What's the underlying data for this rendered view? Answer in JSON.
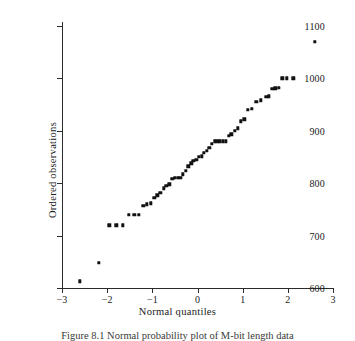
{
  "figure": {
    "caption": "Figure 8.1   Normal probability plot of M-bit length data",
    "caption_number": "Figure 8.1",
    "caption_text": "Normal probability plot of M-bit length data"
  },
  "chart_data": {
    "type": "scatter",
    "title": "",
    "xlabel": "Normal quantiles",
    "ylabel": "Ordered observations",
    "xlim": [
      -3,
      3
    ],
    "ylim": [
      600,
      1100
    ],
    "xticks": [
      -3,
      -2,
      -1,
      0,
      1,
      2,
      3
    ],
    "xticklabels": [
      "−3",
      "−2",
      "−1",
      "0",
      "1",
      "2",
      "3"
    ],
    "yticks": [
      600,
      700,
      800,
      900,
      1000,
      1100
    ],
    "yticklabels": [
      "600",
      "700",
      "800",
      "900",
      "1000",
      "1100"
    ],
    "grid": false,
    "legend": null,
    "marker": "square",
    "marker_color": "#111111",
    "axis_color": "#2b2b2b",
    "series": [
      {
        "name": "Ordered observations vs normal quantiles",
        "points": [
          [
            -2.6,
            613
          ],
          [
            -2.18,
            648
          ],
          [
            -1.95,
            720
          ],
          [
            -1.8,
            720
          ],
          [
            -1.66,
            720
          ],
          [
            -1.52,
            740
          ],
          [
            -1.4,
            740
          ],
          [
            -1.3,
            740
          ],
          [
            -1.2,
            757
          ],
          [
            -1.12,
            760
          ],
          [
            -1.04,
            762
          ],
          [
            -0.96,
            772
          ],
          [
            -0.89,
            777
          ],
          [
            -0.82,
            782
          ],
          [
            -0.75,
            790
          ],
          [
            -0.69,
            795
          ],
          [
            -0.62,
            798
          ],
          [
            -0.56,
            808
          ],
          [
            -0.5,
            810
          ],
          [
            -0.44,
            810
          ],
          [
            -0.38,
            810
          ],
          [
            -0.32,
            817
          ],
          [
            -0.26,
            824
          ],
          [
            -0.2,
            832
          ],
          [
            -0.14,
            838
          ],
          [
            -0.09,
            843
          ],
          [
            -0.03,
            845
          ],
          [
            0.03,
            850
          ],
          [
            0.09,
            851
          ],
          [
            0.14,
            858
          ],
          [
            0.2,
            862
          ],
          [
            0.26,
            868
          ],
          [
            0.32,
            875
          ],
          [
            0.38,
            880
          ],
          [
            0.44,
            880
          ],
          [
            0.5,
            880
          ],
          [
            0.56,
            880
          ],
          [
            0.62,
            880
          ],
          [
            0.69,
            890
          ],
          [
            0.75,
            893
          ],
          [
            0.82,
            900
          ],
          [
            0.89,
            905
          ],
          [
            0.96,
            918
          ],
          [
            1.04,
            922
          ],
          [
            1.12,
            940
          ],
          [
            1.2,
            942
          ],
          [
            1.3,
            955
          ],
          [
            1.4,
            958
          ],
          [
            1.52,
            965
          ],
          [
            1.58,
            966
          ],
          [
            1.66,
            980
          ],
          [
            1.72,
            981
          ],
          [
            1.8,
            982
          ],
          [
            1.88,
            1000
          ],
          [
            1.98,
            1000
          ],
          [
            2.12,
            1000
          ],
          [
            2.6,
            1070
          ]
        ]
      }
    ],
    "n_points": 58
  }
}
